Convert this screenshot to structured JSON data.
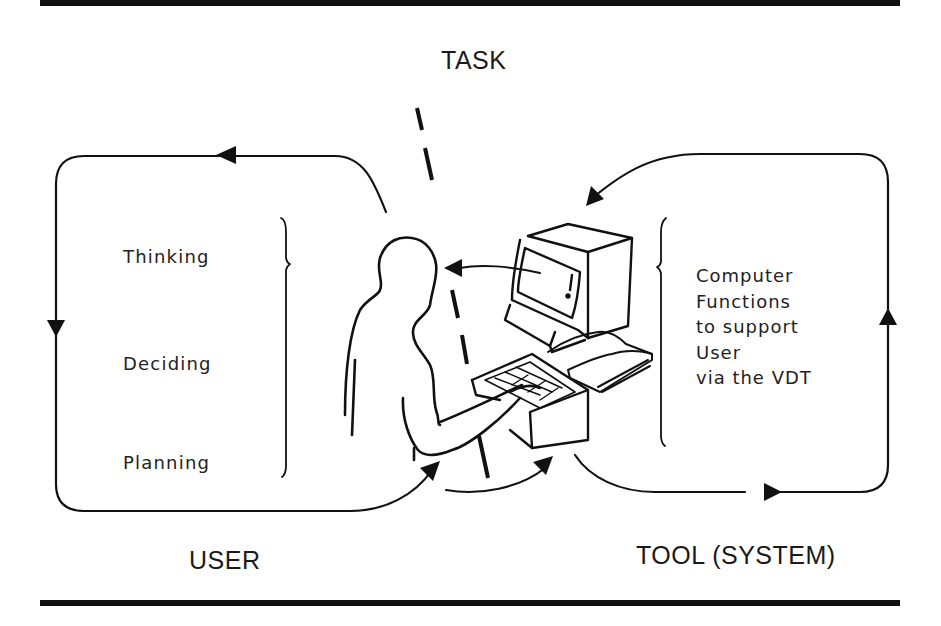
{
  "title": "TASK",
  "regions": {
    "user": {
      "label": "USER",
      "activities": [
        "Thinking",
        "Deciding",
        "Planning"
      ]
    },
    "tool": {
      "label": "TOOL (SYSTEM)",
      "description_lines": [
        "Computer",
        "Functions",
        "to support",
        "User",
        "via the VDT"
      ]
    }
  },
  "icons": {
    "user_figure": "person-silhouette",
    "terminal": "vdt-monitor",
    "keyboard": "keyboard",
    "manual": "open-book",
    "divider": "dashed-task-line"
  },
  "colors": {
    "ink": "#111111",
    "background": "#ffffff"
  }
}
